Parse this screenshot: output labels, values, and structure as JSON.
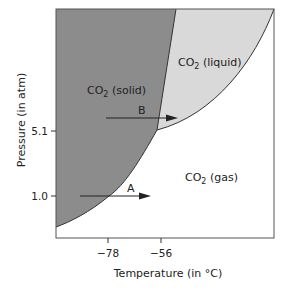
{
  "diagram": {
    "type": "phase-diagram",
    "substance": "CO2",
    "axes": {
      "x_label": "Temperature (in °C)",
      "y_label": "Pressure (in atm)",
      "x_ticks": [
        "−78",
        "−56"
      ],
      "y_ticks": [
        "5.1",
        "1.0"
      ]
    },
    "regions": {
      "solid": {
        "label": "CO",
        "sub": "2",
        "suffix": " (solid)",
        "color": "#8c8c8c"
      },
      "liquid": {
        "label": "CO",
        "sub": "2",
        "suffix": " (liquid)",
        "color": "#d9d9d9"
      },
      "gas": {
        "label": "CO",
        "sub": "2",
        "suffix": " (gas)",
        "color": "#ffffff"
      }
    },
    "arrows": [
      {
        "label": "A"
      },
      {
        "label": "B"
      }
    ]
  }
}
